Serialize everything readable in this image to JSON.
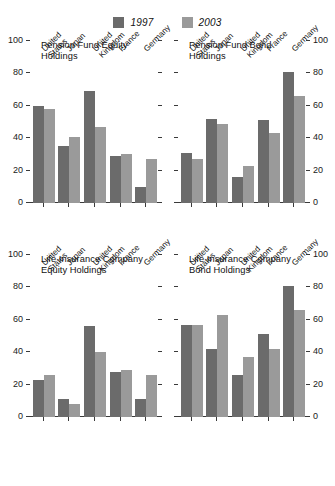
{
  "legend": {
    "entries": [
      {
        "label": "1997",
        "color": "#6b6b6b",
        "name": "legend-1997"
      },
      {
        "label": "2003",
        "color": "#9a9a9a",
        "name": "legend-2003"
      }
    ]
  },
  "axis": {
    "ticks": [
      "0",
      "20",
      "40",
      "60",
      "80",
      "100"
    ],
    "min": 0,
    "max": 100
  },
  "categories": [
    "United\nStates",
    "Japan",
    "United\nKingdom",
    "France",
    "Germany"
  ],
  "chart_data": [
    {
      "type": "bar",
      "title": "Pension Fund Equity\nHoldings",
      "categories": [
        "United States",
        "Japan",
        "United Kingdom",
        "France",
        "Germany"
      ],
      "series": [
        {
          "name": "1997",
          "values": [
            60,
            35,
            69,
            29,
            10
          ]
        },
        {
          "name": "2003",
          "values": [
            58,
            41,
            47,
            30,
            27
          ]
        }
      ],
      "xlabel": "",
      "ylabel": "",
      "ylim": [
        0,
        100
      ],
      "yticks": [
        0,
        20,
        40,
        60,
        80,
        100
      ],
      "axis_side": "left",
      "grid": false
    },
    {
      "type": "bar",
      "title": "Pension Fund Bond\nHoldings",
      "categories": [
        "United States",
        "Japan",
        "United Kingdom",
        "France",
        "Germany"
      ],
      "series": [
        {
          "name": "1997",
          "values": [
            31,
            52,
            16,
            51,
            81
          ]
        },
        {
          "name": "2003",
          "values": [
            27,
            49,
            23,
            43,
            66
          ]
        }
      ],
      "xlabel": "",
      "ylabel": "",
      "ylim": [
        0,
        100
      ],
      "yticks": [
        0,
        20,
        40,
        60,
        80,
        100
      ],
      "axis_side": "right",
      "grid": false
    },
    {
      "type": "bar",
      "title": "Life Insurance Company\nEquity Holdings",
      "categories": [
        "United States",
        "Japan",
        "United Kingdom",
        "France",
        "Germany"
      ],
      "series": [
        {
          "name": "1997",
          "values": [
            23,
            11,
            56,
            28,
            11
          ]
        },
        {
          "name": "2003",
          "values": [
            26,
            8,
            40,
            29,
            26
          ]
        }
      ],
      "xlabel": "",
      "ylabel": "",
      "ylim": [
        0,
        100
      ],
      "yticks": [
        0,
        20,
        40,
        60,
        80,
        100
      ],
      "axis_side": "left",
      "grid": false
    },
    {
      "type": "bar",
      "title": "Life Insurance Company\nBond Holdings",
      "categories": [
        "United States",
        "Japan",
        "United Kingdom",
        "France",
        "Germany"
      ],
      "series": [
        {
          "name": "1997",
          "values": [
            57,
            42,
            26,
            51,
            81
          ]
        },
        {
          "name": "2003",
          "values": [
            57,
            63,
            37,
            42,
            66
          ]
        }
      ],
      "xlabel": "",
      "ylabel": "",
      "ylim": [
        0,
        100
      ],
      "yticks": [
        0,
        20,
        40,
        60,
        80,
        100
      ],
      "axis_side": "right",
      "grid": false
    }
  ]
}
